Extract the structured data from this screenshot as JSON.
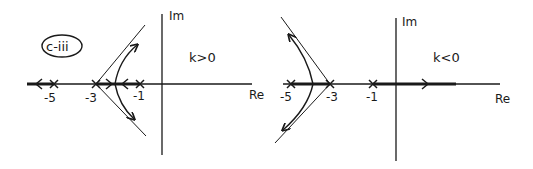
{
  "figure_label": "c-iii",
  "plots": [
    {
      "id": "left",
      "condition": "k>0",
      "axis_labels": {
        "imag": "Im",
        "real": "Re"
      },
      "poles": [
        "-5",
        "-3",
        "-1"
      ]
    },
    {
      "id": "right",
      "condition": "k<0",
      "axis_labels": {
        "imag": "Im",
        "real": "Re"
      },
      "poles": [
        "-5",
        "-3",
        "-1"
      ]
    }
  ],
  "colors": {
    "ink": "#1a1a1a",
    "background": "#ffffff"
  }
}
